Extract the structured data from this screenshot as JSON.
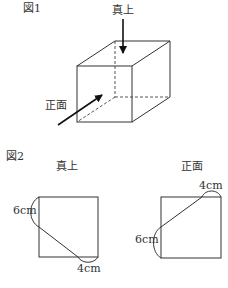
{
  "figure1": {
    "label": "図1",
    "arrow_top_label": "真上",
    "arrow_front_label": "正面",
    "object": "cube"
  },
  "figure2": {
    "label": "図2",
    "views": [
      {
        "title": "真上",
        "measure_side": "6cm",
        "measure_bottom": "4cm"
      },
      {
        "title": "正面",
        "measure_top": "4cm",
        "measure_side": "6cm"
      }
    ]
  }
}
